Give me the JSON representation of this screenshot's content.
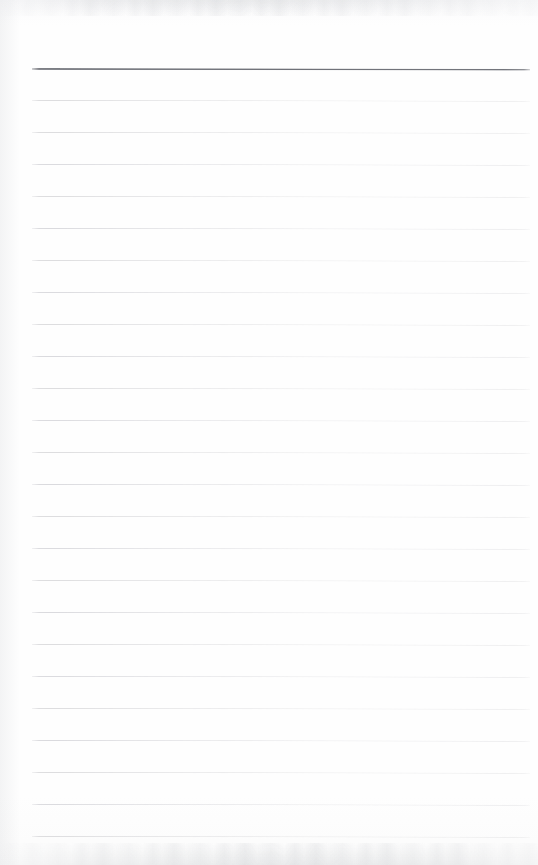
{
  "document": {
    "kind": "scanned-lined-notebook-page",
    "title": "Blank ruled notebook page",
    "page_width": 538,
    "page_height": 865,
    "content_text": "",
    "is_blank": true
  },
  "paper": {
    "background_color": "#fdfdfd",
    "edge_shadow_color": "#aaadb4",
    "surface_label": "paper-surface"
  },
  "ruling": {
    "style": "wide-ruled",
    "line_count": 24,
    "line_spacing_px": 32,
    "first_line_y": 68,
    "last_line_y": 836,
    "line_left_x": 32,
    "line_right_x": 530,
    "line_color": "#dcdcde",
    "header_line_color": "#74767d",
    "header_line_index": 0,
    "tilt_degrees": 0.09,
    "lines": [
      {
        "index": 0,
        "y": 68,
        "emphasis": "header",
        "color": "#74767d",
        "thickness": 2
      },
      {
        "index": 1,
        "y": 100,
        "emphasis": "normal",
        "color": "#dcdcde",
        "thickness": 1
      },
      {
        "index": 2,
        "y": 132,
        "emphasis": "normal",
        "color": "#dcdcde",
        "thickness": 1
      },
      {
        "index": 3,
        "y": 164,
        "emphasis": "normal",
        "color": "#dadade",
        "thickness": 1
      },
      {
        "index": 4,
        "y": 196,
        "emphasis": "normal",
        "color": "#dcdcde",
        "thickness": 1
      },
      {
        "index": 5,
        "y": 228,
        "emphasis": "normal",
        "color": "#d9d9dd",
        "thickness": 1
      },
      {
        "index": 6,
        "y": 260,
        "emphasis": "normal",
        "color": "#dcdcde",
        "thickness": 1
      },
      {
        "index": 7,
        "y": 292,
        "emphasis": "normal",
        "color": "#dadade",
        "thickness": 1
      },
      {
        "index": 8,
        "y": 324,
        "emphasis": "normal",
        "color": "#dcdcde",
        "thickness": 1
      },
      {
        "index": 9,
        "y": 356,
        "emphasis": "normal",
        "color": "#d9d9dd",
        "thickness": 1
      },
      {
        "index": 10,
        "y": 388,
        "emphasis": "normal",
        "color": "#dcdcde",
        "thickness": 1
      },
      {
        "index": 11,
        "y": 420,
        "emphasis": "normal",
        "color": "#dadade",
        "thickness": 1
      },
      {
        "index": 12,
        "y": 452,
        "emphasis": "normal",
        "color": "#dcdcde",
        "thickness": 1
      },
      {
        "index": 13,
        "y": 484,
        "emphasis": "normal",
        "color": "#d9d9dd",
        "thickness": 1
      },
      {
        "index": 14,
        "y": 516,
        "emphasis": "normal",
        "color": "#dcdcde",
        "thickness": 1
      },
      {
        "index": 15,
        "y": 548,
        "emphasis": "normal",
        "color": "#dadade",
        "thickness": 1
      },
      {
        "index": 16,
        "y": 580,
        "emphasis": "normal",
        "color": "#dcdcde",
        "thickness": 1
      },
      {
        "index": 17,
        "y": 612,
        "emphasis": "normal",
        "color": "#d9d9dd",
        "thickness": 1
      },
      {
        "index": 18,
        "y": 644,
        "emphasis": "normal",
        "color": "#dcdcde",
        "thickness": 1
      },
      {
        "index": 19,
        "y": 676,
        "emphasis": "normal",
        "color": "#dadade",
        "thickness": 1
      },
      {
        "index": 20,
        "y": 708,
        "emphasis": "normal",
        "color": "#dcdcde",
        "thickness": 1
      },
      {
        "index": 21,
        "y": 740,
        "emphasis": "normal",
        "color": "#d9d9dd",
        "thickness": 1
      },
      {
        "index": 22,
        "y": 772,
        "emphasis": "normal",
        "color": "#dcdcde",
        "thickness": 1
      },
      {
        "index": 23,
        "y": 804,
        "emphasis": "normal",
        "color": "#dadade",
        "thickness": 1
      },
      {
        "index": 24,
        "y": 836,
        "emphasis": "normal",
        "color": "#dcdcde",
        "thickness": 1
      }
    ]
  },
  "writing_rows": {
    "count": 24,
    "placeholder": "",
    "left_x": 32,
    "width": 498,
    "height": 32
  }
}
